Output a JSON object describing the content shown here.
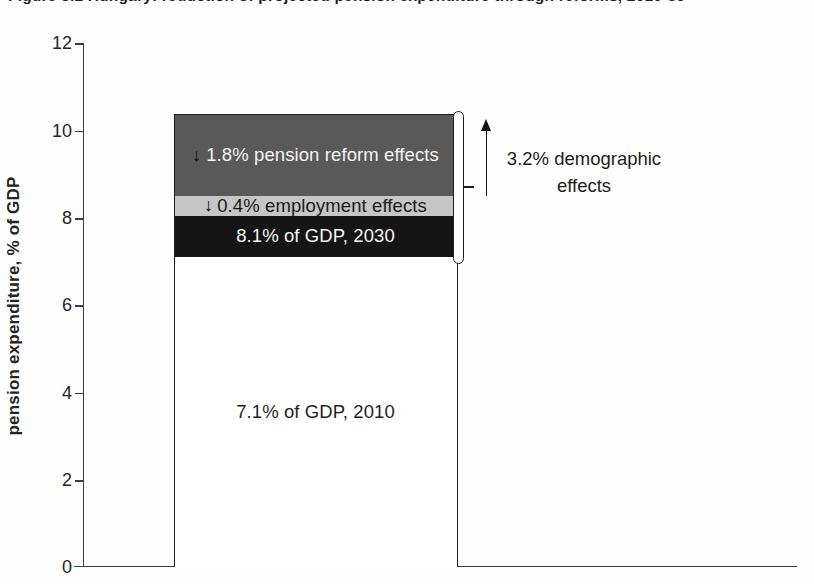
{
  "figure": {
    "caption_clipped": "Figure 8.2 Hungary: reduction of projected pension expenditure through reforms, 2010-30"
  },
  "chart_data": {
    "type": "bar",
    "title": "",
    "ylabel": "pension expenditure, % of GDP",
    "xlabel": "",
    "ylim": [
      0,
      12
    ],
    "ytick_labels": [
      "12",
      "10",
      "8",
      "6",
      "4",
      "2",
      "0"
    ],
    "grid": false,
    "bar": {
      "category": "projected pension expenditure",
      "segments": [
        {
          "name": "2010-level",
          "label": "7.1% of GDP, 2010",
          "from": 0,
          "to": 7.1,
          "fill": "#ffffff",
          "text_color": "#1f1f1f"
        },
        {
          "name": "2030-level",
          "label": "8.1% of GDP, 2030",
          "from": 7.1,
          "to": 8.1,
          "fill": "#151515",
          "text_color": "#ffffff"
        },
        {
          "name": "employment-effects",
          "arrow": "↓",
          "label": "0.4% employment effects",
          "delta": -0.4,
          "from": 8.1,
          "to": 8.5,
          "fill": "#c6c6c6",
          "text_color": "#1a1a1a"
        },
        {
          "name": "pension-reform-effects",
          "arrow": "↓",
          "label": "1.8% pension reform effects",
          "delta": -1.8,
          "from": 8.5,
          "to": 10.3,
          "fill": "#59595a",
          "text_color": "#f4f4f4"
        }
      ]
    },
    "annotation": {
      "text": "3.2% demographic effects",
      "delta": 3.2,
      "span_from": 7.1,
      "span_to": 10.3,
      "arrow_direction": "up"
    },
    "axis_color": "#3d3d3d"
  }
}
